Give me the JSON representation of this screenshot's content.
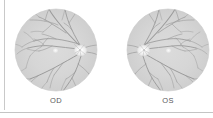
{
  "figure": {
    "type": "fundus-photograph-pair",
    "background_color": "#ffffff",
    "divider_color": "#c9c9c9",
    "panels": [
      {
        "id": "od",
        "label": "OD",
        "eye": "right",
        "disc_side": "right",
        "macula_side": "left"
      },
      {
        "id": "os",
        "label": "OS",
        "eye": "left",
        "disc_side": "left",
        "macula_side": "right"
      }
    ]
  },
  "colors": {
    "retina_fill": "#d6d6d6",
    "retina_edge": "#cacaca",
    "vessel": "#9b9b9b",
    "vessel_light": "#a8a8a8",
    "disc": "#f2f2f2",
    "disc_rim": "#e2e2e2",
    "macula": "#f0f0f0",
    "label_text": "#58585a",
    "page_background": "#ffffff"
  },
  "labels": {
    "od": "OD",
    "os": "OS"
  },
  "geometry": {
    "canvas_width": 213,
    "canvas_height": 118,
    "disc_radius": 40,
    "od_center_x": 55,
    "os_center_x": 167,
    "center_y": 50
  }
}
